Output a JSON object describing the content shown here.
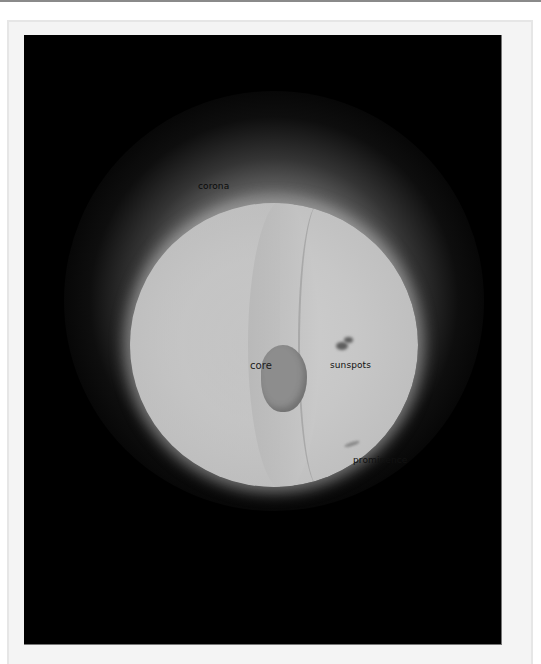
{
  "figure": {
    "background_color": "#000000",
    "frame_color": "#f4f4f4",
    "labels": [
      {
        "id": "corona",
        "text": "corona"
      },
      {
        "id": "core",
        "text": "core"
      },
      {
        "id": "sunspots",
        "text": "sunspots"
      },
      {
        "id": "prominence",
        "text": "prominence"
      }
    ]
  }
}
